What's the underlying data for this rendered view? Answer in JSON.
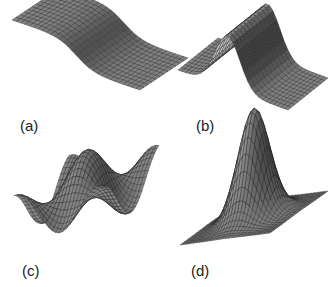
{
  "figure": {
    "panels": [
      {
        "id": "a",
        "label": "(a)",
        "surface": "sigmoid step"
      },
      {
        "id": "b",
        "label": "(b)",
        "surface": "ridge (1D gaussian)"
      },
      {
        "id": "c",
        "label": "(c)",
        "surface": "wavy 2D surface"
      },
      {
        "id": "d",
        "label": "(d)",
        "surface": "2D gaussian peak"
      }
    ],
    "colors": {
      "mesh_dark": "#1a1a1a",
      "mesh_light": "#8a8a8a",
      "background": "#ffffff"
    }
  }
}
